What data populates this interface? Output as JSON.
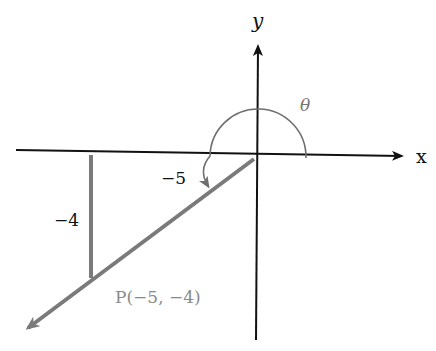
{
  "diagram": {
    "type": "coordinate-plane-angle",
    "axes": {
      "x_label": "x",
      "y_label": "y"
    },
    "angle_label": "θ",
    "point_label": "P(−5, −4)",
    "x_leg_label": "−5",
    "y_leg_label": "−4",
    "point": {
      "x": -5,
      "y": -4
    },
    "colors": {
      "axis": "#111111",
      "terminal_side": "#7a7a7a",
      "arc": "#6e6e6e",
      "point_label": "#8a8a8a"
    }
  }
}
